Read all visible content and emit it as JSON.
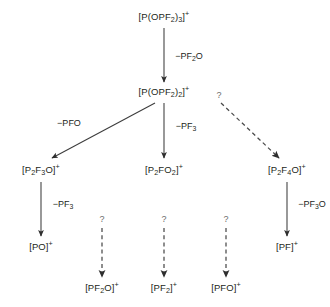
{
  "diagram": {
    "type": "flow-tree",
    "colors": {
      "ink": "#231f20",
      "arrow": "#3c3c3c",
      "dashed_arrow": "#4a4a4a",
      "question": "#6b6b6b",
      "background": "#ffffff"
    },
    "nodes": [
      {
        "id": "n1",
        "label_html": "[P(OPF<sub>2</sub>)<sub>3</sub>]<sup>+</sup>",
        "label_text": "[P(OPF2)3]+",
        "x": 164,
        "y": 17
      },
      {
        "id": "n2",
        "label_html": "[P(OPF<sub>2</sub>)<sub>2</sub>]<sup>+</sup>",
        "label_text": "[P(OPF2)2]+",
        "x": 164,
        "y": 92
      },
      {
        "id": "n3",
        "label_html": "[P<sub>2</sub>F<sub>3</sub>O]<sup>+</sup>",
        "label_text": "[P2F3O]+",
        "x": 41,
        "y": 170
      },
      {
        "id": "n4",
        "label_html": "[P<sub>2</sub>FO<sub>2</sub>]<sup>+</sup>",
        "label_text": "[P2FO2]+",
        "x": 164,
        "y": 170
      },
      {
        "id": "n5",
        "label_html": "[P<sub>2</sub>F<sub>4</sub>O]<sup>+</sup>",
        "label_text": "[P2F4O]+",
        "x": 287,
        "y": 170
      },
      {
        "id": "n6",
        "label_html": "[PO]<sup>+</sup>",
        "label_text": "[PO]+",
        "x": 41,
        "y": 247
      },
      {
        "id": "n7",
        "label_html": "[PF<sub>2</sub>O]<sup>+</sup>",
        "label_text": "[PF2O]+",
        "x": 102,
        "y": 288
      },
      {
        "id": "n8",
        "label_html": "[PF<sub>2</sub>]<sup>+</sup>",
        "label_text": "[PF2]+",
        "x": 164,
        "y": 288
      },
      {
        "id": "n9",
        "label_html": "[PFO]<sup>+</sup>",
        "label_text": "[PFO]+",
        "x": 226,
        "y": 288
      },
      {
        "id": "n10",
        "label_html": "[PF]<sup>+</sup>",
        "label_text": "[PF]+",
        "x": 287,
        "y": 247
      }
    ],
    "edges": [
      {
        "id": "e1",
        "from": "n1",
        "to": "n2",
        "style": "solid",
        "x1": 164,
        "y1": 28,
        "x2": 164,
        "y2": 82,
        "label_html": "−PF<sub>2</sub>O",
        "label_text": "-PF2O",
        "lx": 189,
        "ly": 56
      },
      {
        "id": "e2",
        "from": "n2",
        "to": "n3",
        "style": "solid",
        "x1": 155,
        "y1": 103,
        "x2": 52,
        "y2": 158,
        "label_html": "−PFO",
        "label_text": "-PFO",
        "lx": 69,
        "ly": 123
      },
      {
        "id": "e3",
        "from": "n2",
        "to": "n4",
        "style": "solid",
        "x1": 164,
        "y1": 103,
        "x2": 164,
        "y2": 158,
        "label_html": "−PF<sub>3</sub>",
        "label_text": "-PF3",
        "lx": 186,
        "ly": 126
      },
      {
        "id": "e4",
        "from": "n2",
        "to": "n5",
        "style": "dashed",
        "x1": 221,
        "y1": 103,
        "x2": 279,
        "y2": 158,
        "label_html": "?",
        "label_text": "?",
        "lx": 219,
        "ly": 95,
        "label_kind": "question"
      },
      {
        "id": "e5",
        "from": "n3",
        "to": "n6",
        "style": "solid",
        "x1": 41,
        "y1": 182,
        "x2": 41,
        "y2": 236,
        "label_html": "−PF<sub>3</sub>",
        "label_text": "-PF3",
        "lx": 63,
        "ly": 204
      },
      {
        "id": "e6",
        "from": "n3",
        "to": "n7",
        "style": "dashed",
        "x1": 102,
        "y1": 228,
        "x2": 102,
        "y2": 277,
        "label_html": "?",
        "label_text": "?",
        "lx": 102,
        "ly": 219,
        "label_kind": "question"
      },
      {
        "id": "e7",
        "from": "n4",
        "to": "n8",
        "style": "dashed",
        "x1": 164,
        "y1": 228,
        "x2": 164,
        "y2": 277,
        "label_html": "?",
        "label_text": "?",
        "lx": 164,
        "ly": 219,
        "label_kind": "question"
      },
      {
        "id": "e8",
        "from": "n5",
        "to": "n9",
        "style": "dashed",
        "x1": 226,
        "y1": 228,
        "x2": 226,
        "y2": 277,
        "label_html": "?",
        "label_text": "?",
        "lx": 226,
        "ly": 219,
        "label_kind": "question"
      },
      {
        "id": "e9",
        "from": "n5",
        "to": "n10",
        "style": "solid",
        "x1": 287,
        "y1": 182,
        "x2": 287,
        "y2": 236,
        "label_html": "−PF<sub>3</sub>O",
        "label_text": "-PF3O",
        "lx": 312,
        "ly": 204
      }
    ]
  }
}
